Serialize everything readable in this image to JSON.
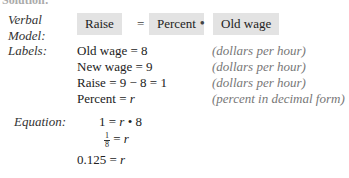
{
  "header": {
    "cutoff_title": "Solution:"
  },
  "verbal_model": {
    "label_line1": "Verbal",
    "label_line2": "Model:",
    "terms": [
      "Raise",
      "Percent",
      "Old wage"
    ],
    "operators": [
      "=",
      "•"
    ]
  },
  "labels": {
    "heading": "Labels:",
    "rows": [
      {
        "expr": "Old wage = 8",
        "unit": "(dollars per hour)"
      },
      {
        "expr": "New wage = 9",
        "unit": "(dollars per hour)"
      },
      {
        "expr": "Raise = 9 − 8 = 1",
        "unit": "(dollars per hour)"
      },
      {
        "expr_text": "Percent = ",
        "expr_var": "r",
        "unit": "(percent in decimal form)"
      }
    ]
  },
  "equation": {
    "heading": "Equation:",
    "line1": {
      "left": "1 = ",
      "var": "r",
      "right": " • 8"
    },
    "line2": {
      "num": "1",
      "den": "8",
      "right_text": " = ",
      "var": "r"
    },
    "line3": {
      "left": "0.125 = ",
      "var": "r"
    }
  }
}
